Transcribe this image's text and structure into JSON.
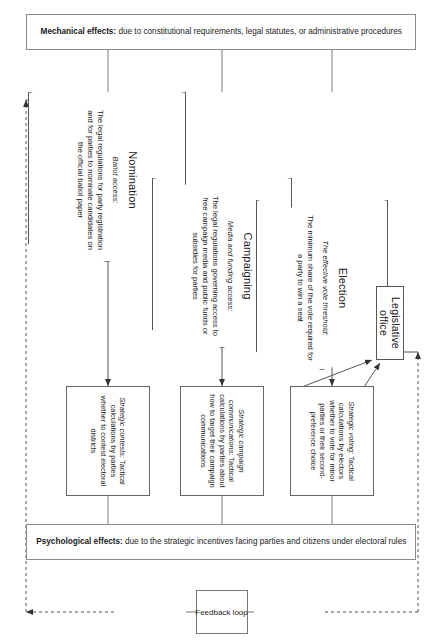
{
  "diagram": {
    "orientation": "rotated-90"
  },
  "brackets": {
    "mechanical": {
      "label_bold": "Mechanical effects:",
      "label_rest": " due to constitutional requirements, legal statutes, or administrative procedures"
    },
    "psychological": {
      "label_bold": "Psychological effects:",
      "label_rest": " due to the strategic incentives facing parties and citizens under electoral rules"
    }
  },
  "stages": [
    {
      "id": "nomination",
      "title": "Nomination",
      "subtitle": "Ballot access:",
      "desc": "The legal regulations for party registration and for parties to nominate candidates on the official ballot paper"
    },
    {
      "id": "campaigning",
      "title": "Campaigning",
      "subtitle": "Media and funding access:",
      "desc": "The legal regulations governing access to free campaign media and public funds or subsidies for parties"
    },
    {
      "id": "election",
      "title": "Election",
      "subtitle": "The effective vote threshold:",
      "desc": "The minimum share of the vote required for a party to win a seat"
    }
  ],
  "outcome": {
    "id": "legislative-office",
    "label": "Legislative office"
  },
  "effects": [
    {
      "id": "strategic-contests",
      "lead": "Strategic contests:",
      "text": " Tactical calculations by parties whether to contest electoral districts"
    },
    {
      "id": "strategic-campaign-communications",
      "lead": "Strategic campaign communications:",
      "text": " Tactical calculations by parties about how to target their campaign communications"
    },
    {
      "id": "strategic-voting",
      "lead": "Strategic voting:",
      "text": " Tactical calculations by electors whether to vote for minor parties or their second-preference choice"
    }
  ],
  "feedback": {
    "label": "Feedback loop"
  },
  "colors": {
    "box_border": "#555555",
    "bracket_border": "#8a8a8a",
    "line": "#555555",
    "text": "#1a1a1a",
    "background": "#ffffff"
  }
}
